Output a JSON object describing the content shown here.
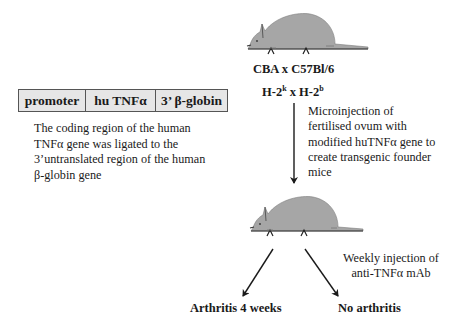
{
  "construct": {
    "segments": [
      {
        "label": "promoter"
      },
      {
        "label": "hu TNFα"
      },
      {
        "label": "3’ β-globin"
      }
    ],
    "fill_color": "#e6e6e6"
  },
  "construct_description": {
    "lines": [
      "The coding region of the human",
      "TNFα gene was ligated to the",
      "3’untranslated region of the human",
      "β-globin gene"
    ]
  },
  "donor_mouse": {
    "strain": "CBA x C57Bl/6",
    "haplotype": {
      "a_base": "H-2",
      "a_sup": "k",
      "sep": " x ",
      "b_base": "H-2",
      "b_sup": "b"
    }
  },
  "microinjection_step": {
    "lines": [
      "Microinjection of",
      "fertilised ovum with",
      "modified huTNFα gene to",
      "create transgenic founder",
      "mice"
    ]
  },
  "treatment_step": {
    "lines": [
      "Weekly injection of",
      "anti-TNFα mAb"
    ]
  },
  "outcomes": {
    "untreated": "Arthritis 4 weeks",
    "treated": "No arthritis"
  },
  "colors": {
    "mouse_fill": "#a6a6a6",
    "line": "#1a1a1a"
  }
}
